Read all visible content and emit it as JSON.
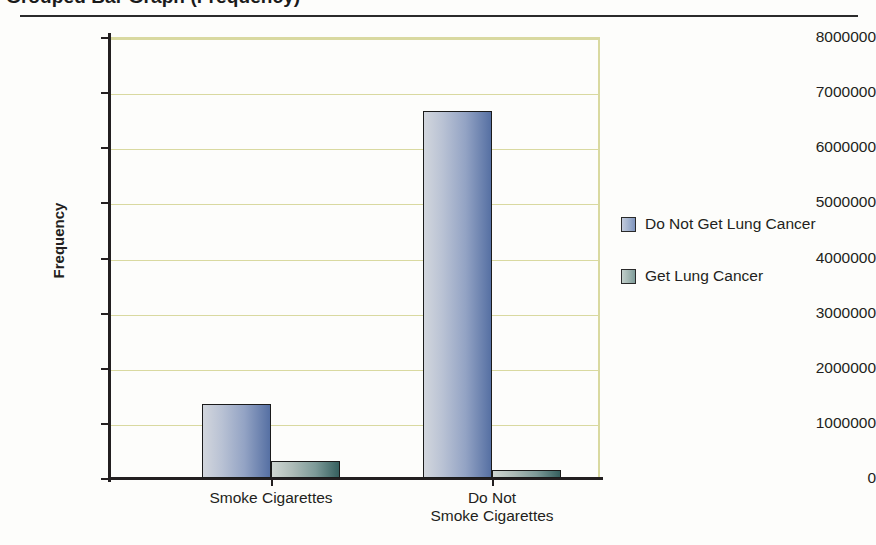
{
  "title": "Grouped Bar Graph (Frequency)",
  "legend": {
    "position": "right",
    "items": [
      {
        "label": "Do Not Get Lung Cancer",
        "swatch": "legend-swatch-blue"
      },
      {
        "label": "Get Lung Cancer",
        "swatch": "legend-swatch-green"
      }
    ]
  },
  "axes": {
    "ylabel": "Frequency",
    "ytick_labels": [
      "8,000,000",
      "7,000,000",
      "6,000,000",
      "5,000,000",
      "4,000,000",
      "3,000,000",
      "2,000,000",
      "1,000,000",
      "0"
    ],
    "xtick_labels": [
      "Smoke Cigarettes",
      "Do Not\nSmoke Cigarettes"
    ]
  },
  "colors": {
    "gridline": "#d9d9a0",
    "axis": "#231f20",
    "series0_light": "#d2d6dd",
    "series0_dark": "#5670a3",
    "series1_light": "#cfd6d2",
    "series1_dark": "#36605f",
    "background": "#fdfdfb"
  },
  "chart_data": {
    "type": "bar",
    "title": "Grouped Bar Graph (Frequency)",
    "xlabel": "",
    "ylabel": "Frequency",
    "categories": [
      "Smoke Cigarettes",
      "Do Not Smoke Cigarettes"
    ],
    "series": [
      {
        "name": "Do Not Get Lung Cancer",
        "values": [
          1350000,
          6650000
        ]
      },
      {
        "name": "Get Lung Cancer",
        "values": [
          300000,
          150000
        ]
      }
    ],
    "ylim": [
      0,
      8000000
    ],
    "ytick_step": 1000000,
    "grid": true,
    "legend_position": "right"
  }
}
